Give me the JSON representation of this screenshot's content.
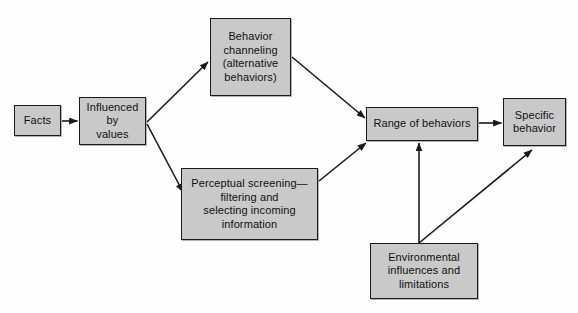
{
  "diagram": {
    "background_color": "#fefefe",
    "node_fill_color": "#c9c9c9",
    "node_border_color": "#1a1a1a",
    "arrow_color": "#1a1a1a",
    "nodes": [
      {
        "id": "facts",
        "label": "Facts"
      },
      {
        "id": "influenced",
        "label": "Influenced\nby\nvalues"
      },
      {
        "id": "channeling",
        "label": "Behavior\nchanneling\n(alternative\nbehaviors)"
      },
      {
        "id": "perceptual",
        "label": "Perceptual screening—\nfiltering and\nselecting incoming\ninformation"
      },
      {
        "id": "range",
        "label": "Range of behaviors"
      },
      {
        "id": "specific",
        "label": "Specific\nbehavior"
      },
      {
        "id": "environment",
        "label": "Environmental\ninfluences and\nlimitations"
      }
    ],
    "edges": [
      {
        "id": "facts-to-influenced",
        "from": "facts",
        "to": "influenced"
      },
      {
        "id": "influenced-to-channeling",
        "from": "influenced",
        "to": "channeling"
      },
      {
        "id": "influenced-to-perceptual",
        "from": "influenced",
        "to": "perceptual"
      },
      {
        "id": "channeling-to-range",
        "from": "channeling",
        "to": "range"
      },
      {
        "id": "perceptual-to-range",
        "from": "perceptual",
        "to": "range"
      },
      {
        "id": "range-to-specific",
        "from": "range",
        "to": "specific"
      },
      {
        "id": "environment-to-range",
        "from": "environment",
        "to": "range"
      },
      {
        "id": "environment-to-specific",
        "from": "environment",
        "to": "specific"
      }
    ]
  }
}
